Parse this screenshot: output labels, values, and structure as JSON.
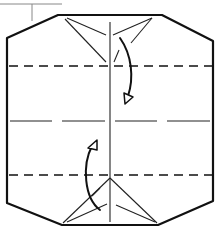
{
  "diagram": {
    "type": "origami-fold-diagram",
    "colors": {
      "line": "#111111",
      "background": "#ffffff",
      "leader": "#888888"
    },
    "outline": [
      [
        58,
        15
      ],
      [
        162,
        15
      ],
      [
        213,
        42
      ],
      [
        213,
        200
      ],
      [
        158,
        225
      ],
      [
        62,
        225
      ],
      [
        7,
        203
      ],
      [
        7,
        38
      ]
    ],
    "center_crease_x": 110,
    "center_crease_horizontal_y": 121,
    "valley_folds_y": [
      66,
      175
    ],
    "arrows": [
      {
        "name": "fold-top-down",
        "from": [
          119,
          36
        ],
        "to": [
          126,
          100
        ]
      },
      {
        "name": "fold-bottom-up",
        "from": [
          99,
          212
        ],
        "to": [
          94,
          143
        ]
      }
    ]
  }
}
